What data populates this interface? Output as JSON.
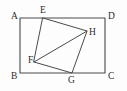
{
  "figure": {
    "kind": "geometry-diagram",
    "canvas": {
      "width": 127,
      "height": 91
    },
    "colors": {
      "background": "#fdfdfd",
      "stroke": "#4a4a4a",
      "label": "#2b2b2b"
    },
    "points": {
      "A": {
        "label": "A",
        "x": 20,
        "y": 18,
        "label_x": 11,
        "label_y": 19
      },
      "B": {
        "label": "B",
        "x": 20,
        "y": 73,
        "label_x": 11,
        "label_y": 79
      },
      "C": {
        "label": "C",
        "x": 105,
        "y": 73,
        "label_x": 108,
        "label_y": 79
      },
      "D": {
        "label": "D",
        "x": 105,
        "y": 18,
        "label_x": 108,
        "label_y": 19
      },
      "E": {
        "label": "E",
        "x": 43,
        "y": 18,
        "label_x": 40,
        "label_y": 13
      },
      "F": {
        "label": "F",
        "x": 34,
        "y": 62,
        "label_x": 28,
        "label_y": 63
      },
      "G": {
        "label": "G",
        "x": 72,
        "y": 73,
        "label_x": 68,
        "label_y": 83
      },
      "H": {
        "label": "H",
        "x": 87,
        "y": 31,
        "label_x": 89,
        "label_y": 35
      }
    },
    "paths": {
      "rectangle": "M 20 18 L 105 18 L 105 73 L 20 73 Z",
      "inner_quad": "M 43 18 L 87 31 L 72 73 L 34 62 Z",
      "diagonal": "M 34 62 L 87 31"
    },
    "segments": [
      {
        "name": "AD",
        "from": "A",
        "to": "D"
      },
      {
        "name": "DC",
        "from": "D",
        "to": "C"
      },
      {
        "name": "CB",
        "from": "C",
        "to": "B"
      },
      {
        "name": "BA",
        "from": "B",
        "to": "A"
      },
      {
        "name": "EH",
        "from": "E",
        "to": "H"
      },
      {
        "name": "HG",
        "from": "H",
        "to": "G"
      },
      {
        "name": "GF",
        "from": "G",
        "to": "F"
      },
      {
        "name": "FE",
        "from": "F",
        "to": "E"
      },
      {
        "name": "FH",
        "from": "F",
        "to": "H"
      }
    ]
  }
}
